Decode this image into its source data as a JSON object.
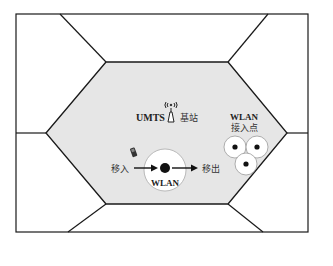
{
  "diagram": {
    "colors": {
      "stroke": "#1a1a1a",
      "center_cell_fill": "#e6e6e6",
      "background": "#ffffff",
      "hotspot_fill": "#ffffff",
      "dot": "#111111"
    },
    "labels": {
      "umts": "UMTS",
      "base_station": "基站",
      "wlan_ap_title": "WLAN",
      "wlan_ap_sub": "接入点",
      "move_in": "移入",
      "move_out": "移出",
      "wlan_center": "WLAN"
    },
    "icons": {
      "base_station": "antenna-tower-icon",
      "mobile": "mobile-phone-icon"
    }
  }
}
